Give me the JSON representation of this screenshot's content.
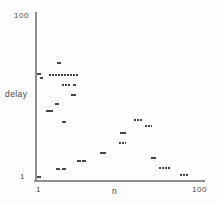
{
  "figure": {
    "background": "#fdfdfd",
    "axis_color": "#8f8f8f",
    "text_color": "#4a4a4a",
    "mark_color": "#474747"
  },
  "labels": {
    "y_top_tick": "100",
    "y_axis_title": "delay",
    "y_bottom_tick": "1",
    "x_left_tick": "1",
    "x_axis_title": "n",
    "x_right_tick": "100"
  },
  "chart_data": {
    "type": "scatter",
    "title": "",
    "xlabel": "n",
    "ylabel": "delay",
    "x_scale": "log",
    "y_scale": "log",
    "xlim": [
      1,
      100
    ],
    "ylim": [
      1,
      100
    ],
    "grid": false,
    "legend": false,
    "x_tick_labels": [
      "1",
      "100"
    ],
    "y_tick_labels": [
      "1",
      "100"
    ],
    "marker_style": "small horizontal dash clusters",
    "points": [
      {
        "n": 1.79,
        "delay": 26.0,
        "w": 4
      },
      {
        "n": 1.02,
        "delay": 19.0,
        "w": 4
      },
      {
        "n": 1.1,
        "delay": 17.0,
        "w": 3
      },
      {
        "n": 2.06,
        "delay": 18.6,
        "w": 29,
        "dashed": true
      },
      {
        "n": 2.24,
        "delay": 13.9,
        "w": 9,
        "dashed": true
      },
      {
        "n": 2.81,
        "delay": 13.9,
        "w": 3
      },
      {
        "n": 2.77,
        "delay": 10.3,
        "w": 5
      },
      {
        "n": 1.69,
        "delay": 8.0,
        "w": 4
      },
      {
        "n": 1.4,
        "delay": 6.7,
        "w": 7
      },
      {
        "n": 2.06,
        "delay": 4.8,
        "w": 4
      },
      {
        "n": 17.1,
        "delay": 5.1,
        "w": 8,
        "dashed": true
      },
      {
        "n": 23.0,
        "delay": 4.3,
        "w": 7,
        "dashed": true
      },
      {
        "n": 11.2,
        "delay": 3.5,
        "w": 6
      },
      {
        "n": 11.0,
        "delay": 2.65,
        "w": 7,
        "dashed": true
      },
      {
        "n": 6.3,
        "delay": 2.0,
        "w": 6
      },
      {
        "n": 3.2,
        "delay": 1.56,
        "w": 4
      },
      {
        "n": 3.65,
        "delay": 1.6,
        "w": 4
      },
      {
        "n": 26.3,
        "delay": 1.72,
        "w": 5
      },
      {
        "n": 35.6,
        "delay": 1.29,
        "w": 11,
        "dashed": true
      },
      {
        "n": 62.6,
        "delay": 1.07,
        "w": 8,
        "dashed": true
      },
      {
        "n": 1.76,
        "delay": 1.24,
        "w": 4
      },
      {
        "n": 2.1,
        "delay": 1.24,
        "w": 4
      },
      {
        "n": 1.03,
        "delay": 1.0,
        "w": 4
      }
    ]
  }
}
